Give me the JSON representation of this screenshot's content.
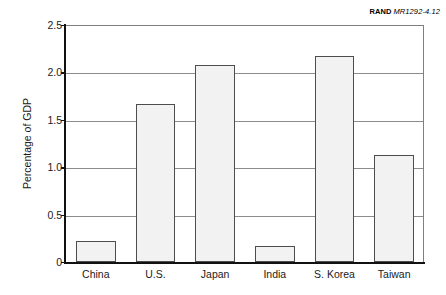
{
  "credit": {
    "organization": "RAND",
    "document_code": "MR1292-4.12"
  },
  "chart_data": {
    "type": "bar",
    "title": "",
    "xlabel": "",
    "ylabel": "Percentage of GDP",
    "categories": [
      "China",
      "U.S.",
      "Japan",
      "India",
      "S. Korea",
      "Taiwan"
    ],
    "values": [
      0.22,
      1.67,
      2.08,
      0.17,
      2.17,
      1.13
    ],
    "ylim": [
      0,
      2.5
    ],
    "ytick_labels": [
      "0",
      "0.5",
      "1.0",
      "1.5",
      "2.0",
      "2.5"
    ],
    "ytick_values": [
      0,
      0.5,
      1.0,
      1.5,
      2.0,
      2.5
    ],
    "gridlines": [
      0.5,
      1.0,
      1.5,
      2.0
    ],
    "grid": true,
    "legend": "none",
    "bar_fill_color": "#f2f2f2",
    "bar_border_color": "#4d4d4d",
    "axis_color": "#111111",
    "gridline_color": "#8c8c8c"
  }
}
